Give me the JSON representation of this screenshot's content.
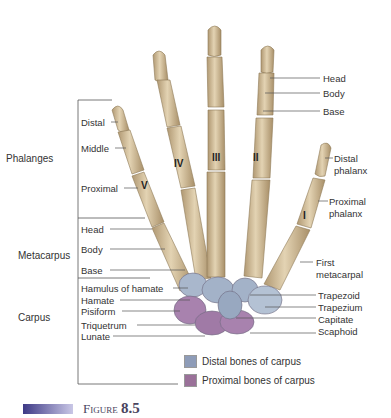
{
  "groups": {
    "phalanges": "Phalanges",
    "metacarpus": "Metacarpus",
    "carpus": "Carpus"
  },
  "left_labels": {
    "distal": "Distal",
    "middle": "Middle",
    "proximal": "Proximal",
    "head": "Head",
    "body": "Body",
    "base": "Base",
    "hamulus": "Hamulus of hamate",
    "hamate": "Hamate",
    "pisiform": "Pisiform",
    "triquetrum": "Triquetrum",
    "lunate": "Lunate"
  },
  "right_labels": {
    "head": "Head",
    "body": "Body",
    "base": "Base",
    "distal_phalanx_1": "Distal",
    "distal_phalanx_2": "phalanx",
    "proximal_phalanx_1": "Proximal",
    "proximal_phalanx_2": "phalanx",
    "first_metacarpal_1": "First",
    "first_metacarpal_2": "metacarpal",
    "trapezoid": "Trapezoid",
    "trapezium": "Trapezium",
    "capitate": "Capitate",
    "scaphoid": "Scaphoid"
  },
  "fingers": {
    "i": "I",
    "ii": "II",
    "iii": "III",
    "iv": "IV",
    "v": "V"
  },
  "legend": {
    "distal": {
      "label": "Distal bones of carpus",
      "color": "#8e9cb8"
    },
    "proximal": {
      "label": "Proximal bones of carpus",
      "color": "#9a7199"
    }
  },
  "figure": {
    "prefix": "Figure",
    "number": "8.5"
  },
  "colors": {
    "bone": "#d9c6a3",
    "bone_shade": "#b59e78",
    "carpal_distal": "#a3b2c8",
    "carpal_proximal": "#a882ae"
  }
}
